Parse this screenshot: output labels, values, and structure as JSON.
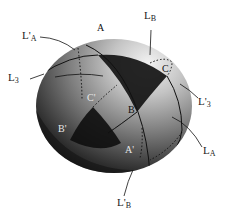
{
  "diagram": {
    "type": "sphere-spherical-triangles",
    "colors": {
      "sphere_light": "#d8d8d8",
      "sphere_mid": "#8a8a8a",
      "sphere_dark": "#2a2a2a",
      "triangle_fill": "#1a1a1a",
      "line": "#111111",
      "label": "#222222",
      "vertex_label_light": "#e8e8e8",
      "vertex_label_dark": "#111111"
    },
    "vertices": [
      {
        "id": "A",
        "main": "A",
        "prime": "",
        "x": 95,
        "y": 29,
        "tone": "dark"
      },
      {
        "id": "C",
        "main": "C",
        "prime": "",
        "x": 163,
        "y": 67,
        "tone": "dark"
      },
      {
        "id": "B",
        "main": "B",
        "prime": "",
        "x": 129,
        "y": 108,
        "tone": "dark"
      },
      {
        "id": "C'",
        "main": "C",
        "prime": "'",
        "x": 87,
        "y": 93,
        "tone": "light"
      },
      {
        "id": "B'",
        "main": "B",
        "prime": "'",
        "x": 58,
        "y": 125,
        "tone": "light"
      },
      {
        "id": "A'",
        "main": "A",
        "prime": "'",
        "x": 125,
        "y": 147,
        "tone": "light"
      }
    ],
    "lines": [
      {
        "id": "L_B",
        "main": "L",
        "sub": "B",
        "prime": "",
        "x": 146,
        "y": 10
      },
      {
        "id": "L'_A",
        "main": "L",
        "sub": "A",
        "prime": "'",
        "x": 24,
        "y": 31
      },
      {
        "id": "L_3",
        "main": "L",
        "sub": "3",
        "prime": "",
        "x": 8,
        "y": 71
      },
      {
        "id": "L'_3",
        "main": "L",
        "sub": "3",
        "prime": "'",
        "x": 200,
        "y": 96
      },
      {
        "id": "L_A",
        "main": "L",
        "sub": "A",
        "prime": "",
        "x": 204,
        "y": 145
      },
      {
        "id": "L'_B",
        "main": "L",
        "sub": "B",
        "prime": "'",
        "x": 118,
        "y": 198
      }
    ]
  }
}
